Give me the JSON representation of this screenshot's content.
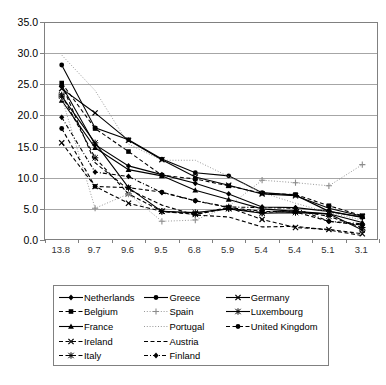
{
  "chart_data": {
    "type": "line",
    "title": "",
    "xlabel": "",
    "ylabel": "",
    "ylim": [
      0.0,
      35.0
    ],
    "ytick_labels": [
      "35.0",
      "30.0",
      "25.0",
      "20.0",
      "15.0",
      "10.0",
      "5.0",
      "0.0"
    ],
    "ytick_values": [
      35.0,
      30.0,
      25.0,
      20.0,
      15.0,
      10.0,
      5.0,
      0.0
    ],
    "grid": true,
    "legend_position": "bottom",
    "categories": [
      "13.8",
      "9.7",
      "9.6",
      "9.5",
      "6.8",
      "5.9",
      "5.4",
      "5.4",
      "5.1",
      "3.1"
    ],
    "series": [
      {
        "name": "Netherlands",
        "marker": "diamond",
        "line": "solid",
        "values": [
          24.8,
          15.3,
          11.9,
          10.5,
          9.1,
          7.4,
          5.3,
          5.2,
          4.6,
          3.6
        ]
      },
      {
        "name": "Belgium",
        "marker": "square",
        "line": "dashed",
        "values": [
          25.2,
          17.9,
          14.2,
          10.4,
          9.8,
          8.7,
          7.5,
          7.3,
          5.5,
          3.9
        ]
      },
      {
        "name": "France",
        "marker": "triangle",
        "line": "solid",
        "values": [
          22.4,
          14.8,
          11.3,
          10.3,
          8.0,
          6.5,
          5.0,
          4.6,
          4.2,
          2.8
        ]
      },
      {
        "name": "Ireland",
        "marker": "cross",
        "line": "dashed",
        "values": [
          15.6,
          8.6,
          5.9,
          4.6,
          4.2,
          5.2,
          3.3,
          2.0,
          1.7,
          1.0
        ]
      },
      {
        "name": "Italy",
        "marker": "star",
        "line": "dashed",
        "values": [
          23.3,
          13.2,
          7.4,
          4.6,
          4.1,
          5.1,
          4.4,
          4.7,
          3.8,
          2.0
        ]
      },
      {
        "name": "Greece",
        "marker": "circle",
        "line": "solid",
        "values": [
          28.1,
          18.0,
          16.1,
          13.0,
          10.8,
          10.3,
          7.6,
          7.2,
          4.6,
          3.7
        ]
      },
      {
        "name": "Spain",
        "marker": "plus",
        "line": "dotted",
        "values": [
          22.9,
          5.1,
          7.4,
          3.0,
          3.2,
          5.4,
          9.6,
          9.2,
          8.7,
          12.1
        ]
      },
      {
        "name": "Portugal",
        "marker": "none",
        "line": "dotted",
        "values": [
          29.7,
          24.0,
          15.4,
          12.8,
          12.8,
          10.2,
          7.6,
          5.9,
          4.4,
          3.2
        ]
      },
      {
        "name": "Austria",
        "marker": "none",
        "line": "dashed",
        "values": [
          25.0,
          12.4,
          8.1,
          5.6,
          4.0,
          3.7,
          2.1,
          2.2,
          1.6,
          0.7
        ]
      },
      {
        "name": "Finland",
        "marker": "diamond",
        "line": "dashdot",
        "values": [
          19.7,
          10.9,
          10.2,
          7.6,
          6.3,
          5.3,
          5.2,
          5.1,
          3.0,
          2.6
        ]
      },
      {
        "name": "Germany",
        "marker": "cross",
        "line": "solid",
        "values": [
          24.3,
          20.4,
          16.0,
          12.9,
          10.1,
          8.8,
          7.4,
          7.1,
          5.1,
          3.8
        ]
      },
      {
        "name": "Luxembourg",
        "marker": "star",
        "line": "solid",
        "values": [
          23.1,
          15.6,
          8.4,
          4.6,
          4.4,
          5.0,
          4.3,
          4.4,
          4.2,
          1.6
        ]
      },
      {
        "name": "United Kingdom",
        "marker": "circle",
        "line": "dashed",
        "values": [
          17.9,
          8.6,
          8.4,
          7.7,
          6.3,
          5.2,
          4.6,
          4.5,
          3.0,
          2.4
        ]
      }
    ]
  },
  "legend": {
    "columns": [
      {
        "items": [
          {
            "label": "Netherlands",
            "series": 0
          },
          {
            "label": "Belgium",
            "series": 1
          },
          {
            "label": "France",
            "series": 2
          },
          {
            "label": "Ireland",
            "series": 3
          },
          {
            "label": "Italy",
            "series": 4
          }
        ]
      },
      {
        "items": [
          {
            "label": "Greece",
            "series": 5
          },
          {
            "label": "Spain",
            "series": 6
          },
          {
            "label": "Portugal",
            "series": 7
          },
          {
            "label": "Austria",
            "series": 8
          },
          {
            "label": "Finland",
            "series": 9
          }
        ]
      },
      {
        "items": [
          {
            "label": "Germany",
            "series": 10
          },
          {
            "label": "Luxembourg",
            "series": 11
          },
          {
            "label": "United Kingdom",
            "series": 12
          }
        ]
      }
    ]
  },
  "colors": {
    "series": "#000000",
    "grid": "#a6a6a6",
    "axis": "#808080",
    "background": "#ffffff",
    "text": "#000000"
  }
}
